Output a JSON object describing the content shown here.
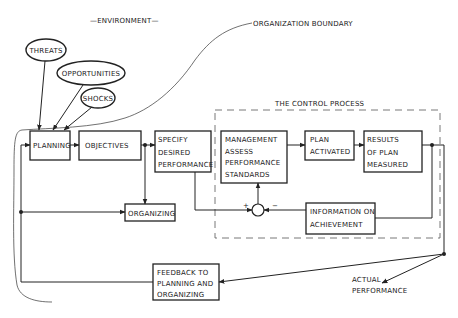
{
  "diagram": {
    "environment_label": "—ENVIRONMENT—",
    "organization_boundary_label": "ORGANIZATION BOUNDARY",
    "control_process_label": "THE CONTROL PROCESS",
    "inputs": {
      "threats": "THREATS",
      "opportunities": "OPPORTUNITIES",
      "shocks": "SHOCKS"
    },
    "boxes": {
      "planning": [
        "PLANNING"
      ],
      "objectives": [
        "OBJECTIVES"
      ],
      "specify": [
        "SPECIFY",
        "DESIRED",
        "PERFORMANCE"
      ],
      "management": [
        "MANAGEMENT",
        "ASSESS",
        "PERFORMANCE",
        "STANDARDS"
      ],
      "plan_activated": [
        "PLAN",
        "ACTIVATED"
      ],
      "results": [
        "RESULTS",
        "OF PLAN",
        "MEASURED"
      ],
      "organizing": [
        "ORGANIZING"
      ],
      "information": [
        "INFORMATION ON",
        "ACHIEVEMENT"
      ],
      "feedback": [
        "FEEDBACK TO",
        "PLANNING AND",
        "ORGANIZING"
      ]
    },
    "comparator": {
      "plus": "+",
      "minus": "−"
    },
    "actual_performance": [
      "ACTUAL",
      "PERFORMANCE"
    ]
  }
}
